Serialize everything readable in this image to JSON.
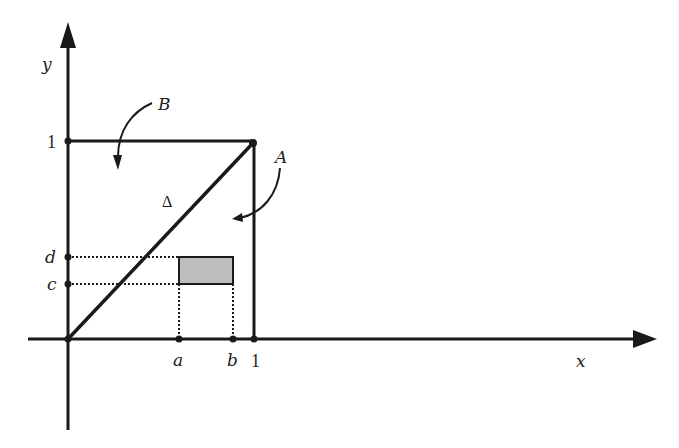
{
  "diagram": {
    "type": "unit-square-region",
    "axes": {
      "x_label": "x",
      "y_label": "y"
    },
    "ticks": {
      "x_one": "1",
      "y_one": "1",
      "a": "a",
      "b": "b",
      "c": "c",
      "d": "d"
    },
    "regions": {
      "A": "A",
      "B": "B",
      "diagonal": "Δ"
    },
    "shaded_rectangle": {
      "x_range": [
        "a",
        "b"
      ],
      "y_range": [
        "c",
        "d"
      ],
      "fill": "#bdbdbd"
    },
    "colors": {
      "line": "#1a1a1a",
      "background": "#ffffff"
    }
  }
}
